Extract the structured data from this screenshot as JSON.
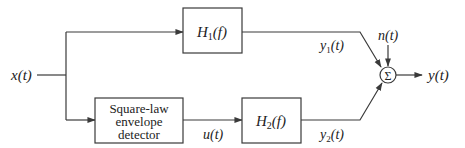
{
  "diagram": {
    "type": "block-diagram",
    "input": {
      "label": "x(t)"
    },
    "blocks": [
      {
        "id": "h1",
        "label_main": "H",
        "label_sub": "1",
        "label_arg": "(f)"
      },
      {
        "id": "detector",
        "lines": [
          "Square-law",
          "envelope",
          "detector"
        ]
      },
      {
        "id": "h2",
        "label_main": "H",
        "label_sub": "2",
        "label_arg": "(f)"
      }
    ],
    "summer": {
      "symbol": "Σ"
    },
    "signals": {
      "u": "u(t)",
      "y1_main": "y",
      "y1_sub": "1",
      "y1_arg": "(t)",
      "y2_main": "y",
      "y2_sub": "2",
      "y2_arg": "(t)",
      "noise": "n(t)",
      "output": "y(t)"
    }
  }
}
